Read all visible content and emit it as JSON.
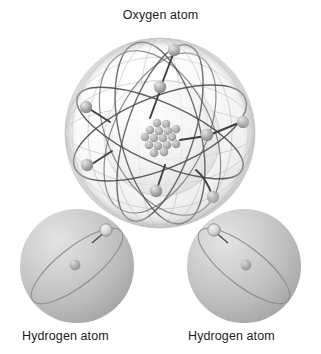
{
  "figure": {
    "title": "Oxygen atom",
    "background_color": "#ffffff",
    "label_color": "#1c1c1c"
  },
  "labels": {
    "oxygen": "Oxygen atom",
    "hydrogen_left": "Hydrogen atom",
    "hydrogen_right": "Hydrogen atom"
  },
  "atoms": {
    "oxygen": {
      "name": "Oxygen atom",
      "center_x": 160,
      "center_y": 133,
      "outer_shell_radius": 95,
      "inner_shell_radius": 58,
      "nucleus_particle_count": 16,
      "electron_count": 8,
      "outer_shell_color": "#f2f2f2",
      "inner_shell_color": "#e8e8e8",
      "orbit_color": "#4a4a4a",
      "electron_color": "#9a9a9a",
      "nucleus_color": "#b0b0b0",
      "electrons": [
        {
          "x": 174,
          "y": 50
        },
        {
          "x": 160,
          "y": 87
        },
        {
          "x": 86,
          "y": 107
        },
        {
          "x": 87,
          "y": 165
        },
        {
          "x": 243,
          "y": 122
        },
        {
          "x": 207,
          "y": 135
        },
        {
          "x": 156,
          "y": 191
        },
        {
          "x": 213,
          "y": 197
        }
      ]
    },
    "hydrogen_left": {
      "name": "Hydrogen atom",
      "center_x": 77,
      "center_y": 266,
      "radius": 57,
      "sphere_color": "#b9b9b9",
      "orbit_color": "#6e6e6e",
      "electron_color": "#cfcfcf",
      "nucleus_color": "#a8a8a8",
      "electron_count": 1,
      "electron": {
        "x": 106,
        "y": 230
      },
      "nucleus": {
        "x": 75,
        "y": 265
      }
    },
    "hydrogen_right": {
      "name": "Hydrogen atom",
      "center_x": 244,
      "center_y": 266,
      "radius": 57,
      "sphere_color": "#b9b9b9",
      "orbit_color": "#6e6e6e",
      "electron_color": "#cfcfcf",
      "nucleus_color": "#a8a8a8",
      "electron_count": 1,
      "electron": {
        "x": 214,
        "y": 230
      },
      "nucleus": {
        "x": 246,
        "y": 265
      }
    }
  }
}
